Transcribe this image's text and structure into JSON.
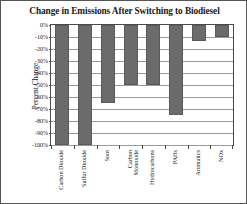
{
  "chart_data": {
    "type": "bar",
    "title": "Change in Emissions After Switching to Biodiesel",
    "xlabel": "",
    "ylabel": "Percent Change",
    "categories": [
      "Carbon Dioxide",
      "Sulfur Dioxide",
      "Soot",
      "Carbon\nMonoxide",
      "Hydrocarbons",
      "PAHs",
      "Aromatics",
      "NOx"
    ],
    "values": [
      -100,
      -100,
      -65,
      -50,
      -50,
      -75,
      -13,
      -10
    ],
    "ylim": [
      -100,
      0
    ],
    "yticks": [
      0,
      -10,
      -20,
      -30,
      -40,
      -50,
      -60,
      -70,
      -80,
      -90,
      -100
    ],
    "yticklabels": [
      "0%",
      "-10%",
      "-20%",
      "-30%",
      "-40%",
      "-50%",
      "-60%",
      "-70%",
      "-80%",
      "-90%",
      "-100%"
    ],
    "grid": true,
    "legend": null,
    "bar_color": "#6b6b6b",
    "background_color": "#ffffff",
    "axis_color": "#4a4a4a",
    "gridline_color": "#9a9a9a"
  }
}
